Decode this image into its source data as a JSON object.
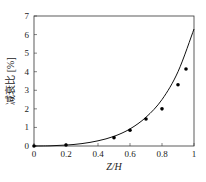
{
  "chart_data": {
    "type": "scatter",
    "title": "",
    "xlabel": "Z/H",
    "ylabel": "减衰比 [%]",
    "xlim": [
      0,
      1
    ],
    "ylim": [
      0,
      7
    ],
    "xticks": [
      0,
      0.2,
      0.4,
      0.6,
      0.8,
      1
    ],
    "xtick_labels": [
      "0",
      "0.2",
      "0.4",
      "0.6",
      "0.8",
      "1"
    ],
    "yticks": [
      0,
      1,
      2,
      3,
      4,
      5,
      6,
      7
    ],
    "ytick_labels": [
      "0",
      "1",
      "2",
      "3",
      "4",
      "5",
      "6",
      "7"
    ],
    "grid": false,
    "series": [
      {
        "name": "measured",
        "kind": "scatter",
        "x": [
          0,
          0.2,
          0.5,
          0.6,
          0.7,
          0.8,
          0.9,
          0.95
        ],
        "y": [
          0.0,
          0.05,
          0.45,
          0.85,
          1.45,
          2.0,
          3.3,
          4.15
        ]
      },
      {
        "name": "fit",
        "kind": "line",
        "x": [
          0,
          0.1,
          0.2,
          0.3,
          0.4,
          0.5,
          0.6,
          0.7,
          0.8,
          0.9,
          1.0
        ],
        "y": [
          0.0,
          0.01,
          0.05,
          0.13,
          0.28,
          0.52,
          0.92,
          1.55,
          2.5,
          4.0,
          6.3
        ]
      }
    ]
  }
}
